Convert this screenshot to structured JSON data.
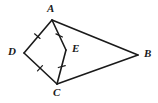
{
  "figure": {
    "type": "geometry-diagram",
    "background_color": "#ffffff",
    "stroke_color": "#1a1a1a",
    "label_color": "#1a1a1a",
    "stroke_width": 1.6,
    "tick_stroke_width": 1.2
  },
  "points": [
    {
      "name": "A",
      "label": "A",
      "x": 52,
      "y": 20,
      "label_x": 47,
      "label_y": 3
    },
    {
      "name": "B",
      "label": "B",
      "x": 138,
      "y": 55,
      "label_x": 144,
      "label_y": 48
    },
    {
      "name": "C",
      "label": "C",
      "x": 57,
      "y": 84,
      "label_x": 53,
      "label_y": 87
    },
    {
      "name": "D",
      "label": "D",
      "x": 24,
      "y": 53,
      "label_x": 8,
      "label_y": 46
    },
    {
      "name": "E",
      "label": "E",
      "x": 66,
      "y": 50,
      "label_x": 72,
      "label_y": 43
    }
  ],
  "segments": [
    {
      "name": "segment-AD",
      "from": "A",
      "to": "D",
      "x1": 52,
      "y1": 20,
      "x2": 24,
      "y2": 53,
      "ticks": 1
    },
    {
      "name": "segment-DC",
      "from": "D",
      "to": "C",
      "x1": 24,
      "y1": 53,
      "x2": 57,
      "y2": 84,
      "ticks": 1
    },
    {
      "name": "segment-AE",
      "from": "A",
      "to": "E",
      "x1": 52,
      "y1": 20,
      "x2": 66,
      "y2": 50,
      "ticks": 1
    },
    {
      "name": "segment-EC",
      "from": "E",
      "to": "C",
      "x1": 66,
      "y1": 50,
      "x2": 57,
      "y2": 84,
      "ticks": 1
    },
    {
      "name": "segment-AB",
      "from": "A",
      "to": "B",
      "x1": 52,
      "y1": 20,
      "x2": 138,
      "y2": 55,
      "ticks": 0
    },
    {
      "name": "segment-CB",
      "from": "C",
      "to": "B",
      "x1": 57,
      "y1": 84,
      "x2": 138,
      "y2": 55,
      "ticks": 0
    }
  ],
  "tick_marks": [
    {
      "name": "tick-AD",
      "on_segment": "segment-AD",
      "x": 37.3,
      "y": 36.1,
      "angle": -49.7
    },
    {
      "name": "tick-AE",
      "on_segment": "segment-AE",
      "x": 59.2,
      "y": 35.4,
      "angle": -65.0
    },
    {
      "name": "tick-DC",
      "on_segment": "segment-DC",
      "x": 40.0,
      "y": 68.2,
      "angle": 43.2
    },
    {
      "name": "tick-EC",
      "on_segment": "segment-EC",
      "x": 61.8,
      "y": 66.6,
      "angle": 75.1
    }
  ]
}
